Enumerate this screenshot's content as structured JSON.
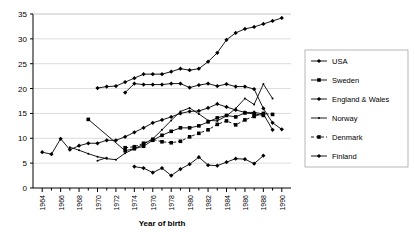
{
  "chart_data": {
    "type": "line",
    "title": "",
    "xlabel": "Year of birth",
    "ylabel": "",
    "xlim": [
      1963,
      1991
    ],
    "ylim": [
      0,
      35
    ],
    "ytick_step": 5,
    "xtick_step": 2,
    "grid": true,
    "legend_position": "right",
    "yticks": [
      "0",
      "5",
      "10",
      "15",
      "20",
      "25",
      "30",
      "35"
    ],
    "xticks": [
      "1964",
      "1966",
      "1968",
      "1970",
      "1972",
      "1974",
      "1976",
      "1978",
      "1980",
      "1982",
      "1984",
      "1986",
      "1988",
      "1990"
    ],
    "series": [
      {
        "name": "USA",
        "marker": "diamond",
        "dash": "solid",
        "x": [
          1970,
          1971,
          1972,
          1973,
          1974,
          1975,
          1976,
          1977,
          1978,
          1979,
          1980,
          1981,
          1982,
          1983,
          1984,
          1985,
          1986,
          1987,
          1988,
          1989,
          1990
        ],
        "y": [
          20.1,
          20.4,
          20.5,
          21.3,
          22.1,
          22.9,
          22.9,
          22.9,
          23.4,
          24.0,
          23.7,
          24.0,
          25.4,
          27.2,
          29.8,
          31.2,
          32.0,
          32.4,
          33.0,
          33.6,
          34.2
        ]
      },
      {
        "name": "Sweden",
        "marker": "square",
        "dash": "solid",
        "x": [
          1969,
          1973,
          1974,
          1975,
          1976,
          1977,
          1978,
          1979,
          1980,
          1981,
          1982,
          1983,
          1984,
          1985,
          1986,
          1987,
          1988
        ],
        "y": [
          13.8,
          7.5,
          7.9,
          8.4,
          9.6,
          10.6,
          11.4,
          12.1,
          12.1,
          12.5,
          13.3,
          14.1,
          14.6,
          14.3,
          15.1,
          14.9,
          14.6
        ]
      },
      {
        "name": "England & Wales",
        "marker": "diamond",
        "dash": "solid",
        "x": [
          1964,
          1965,
          1966,
          1967,
          1968,
          1969,
          1970,
          1971,
          1972,
          1973,
          1974,
          1975,
          1976,
          1977,
          1978,
          1979,
          1980,
          1981,
          1982,
          1983,
          1984,
          1985,
          1986,
          1987,
          1988,
          1989
        ],
        "y": [
          7.2,
          6.8,
          9.9,
          7.7,
          8.5,
          9.0,
          9.0,
          9.6,
          9.6,
          10.3,
          11.2,
          12.1,
          13.1,
          13.7,
          14.3,
          15.0,
          15.4,
          15.5,
          16.1,
          16.9,
          16.3,
          15.7,
          15.2,
          15.2,
          14.9,
          11.7
        ]
      },
      {
        "name": "Norway",
        "marker": "dot",
        "dash": "solid",
        "x": [
          1967,
          1968,
          1969,
          1970,
          1971,
          1972,
          1973,
          1974,
          1975,
          1976,
          1977,
          1978,
          1979,
          1980,
          1981,
          1982,
          1983,
          1984,
          1985,
          1986,
          1987,
          1988,
          1989
        ],
        "y": [
          8.2,
          7.6,
          6.9,
          6.3,
          5.9,
          5.7,
          7.0,
          7.9,
          8.8,
          9.9,
          11.7,
          13.6,
          15.4,
          16.1,
          14.9,
          13.6,
          13.5,
          14.5,
          16.0,
          18.0,
          16.8,
          20.9,
          18.0
        ]
      },
      {
        "name": "Denmark",
        "marker": "square",
        "dash": "dashed",
        "x": [
          1973,
          1974,
          1975,
          1976,
          1977,
          1978,
          1979,
          1980,
          1981,
          1982,
          1983,
          1984,
          1985,
          1986,
          1987,
          1988,
          1989
        ],
        "y": [
          8.1,
          8.3,
          9.0,
          9.8,
          9.3,
          9.1,
          9.4,
          10.3,
          11.0,
          11.7,
          12.8,
          13.5,
          12.7,
          13.7,
          14.4,
          15.0,
          14.8
        ]
      },
      {
        "name": "Finland",
        "marker": "diamond",
        "dash": "solid",
        "x": [
          1973,
          1974,
          1975,
          1976,
          1977,
          1978,
          1979,
          1980,
          1981,
          1982,
          1983,
          1984,
          1985,
          1986,
          1987,
          1988,
          1989,
          1990
        ],
        "y": [
          19.2,
          21.0,
          20.8,
          20.8,
          20.8,
          21.0,
          21.0,
          20.2,
          20.7,
          21.0,
          20.5,
          20.9,
          20.4,
          20.4,
          19.9,
          16.0,
          13.1,
          11.8
        ]
      },
      {
        "name": "Finland-low",
        "marker": "diamond",
        "dash": "solid",
        "hide_in_legend": true,
        "x": [
          1974,
          1975,
          1976,
          1977,
          1978,
          1979,
          1980,
          1981,
          1982,
          1983,
          1984,
          1985,
          1986,
          1987,
          1988
        ],
        "y": [
          4.3,
          4.0,
          3.1,
          4.0,
          2.5,
          3.8,
          4.8,
          6.2,
          4.6,
          4.5,
          5.2,
          5.9,
          5.8,
          4.9,
          6.5
        ]
      },
      {
        "name": "Norway-early",
        "marker": "dot",
        "dash": "solid",
        "hide_in_legend": true,
        "x": [
          1970,
          1971
        ],
        "y": [
          5.5,
          6.1
        ]
      }
    ],
    "legend": [
      {
        "label": "USA",
        "marker": "diamond",
        "dash": "solid"
      },
      {
        "label": "Sweden",
        "marker": "square",
        "dash": "solid"
      },
      {
        "label": "England & Wales",
        "marker": "diamond",
        "dash": "solid"
      },
      {
        "label": "Norway",
        "marker": "dot",
        "dash": "solid"
      },
      {
        "label": "Denmark",
        "marker": "square",
        "dash": "dashed"
      },
      {
        "label": "Finland",
        "marker": "diamond",
        "dash": "solid"
      }
    ],
    "colors": {
      "series": "#000000",
      "grid": "#cccccc",
      "axis": "#000000",
      "background": "#ffffff"
    }
  }
}
